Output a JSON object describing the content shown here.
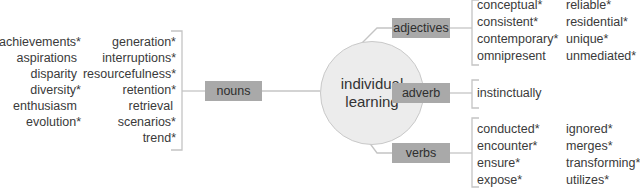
{
  "center": {
    "line1": "individual",
    "line2": "learning"
  },
  "branches": {
    "nouns": {
      "label": "nouns",
      "col1": [
        "achievements*",
        "aspirations",
        "disparity",
        "diversity*",
        "enthusiasm",
        "evolution*"
      ],
      "col2": [
        "generation*",
        "interruptions*",
        "resourcefulness*",
        "retention*",
        "retrieval",
        "scenarios*",
        "trend*"
      ]
    },
    "adjectives": {
      "label": "adjectives",
      "col1": [
        "conceptual*",
        "consistent*",
        "contemporary*",
        "omnipresent"
      ],
      "col2": [
        "reliable*",
        "residential*",
        "unique*",
        "unmediated*"
      ]
    },
    "adverb": {
      "label": "adverb",
      "col1": [
        "instinctually"
      ]
    },
    "verbs": {
      "label": "verbs",
      "col1": [
        "conducted*",
        "encounter*",
        "ensure*",
        "expose*"
      ],
      "col2": [
        "ignored*",
        "merges*",
        "transforming*",
        "utilizes*"
      ]
    }
  },
  "colors": {
    "box": "#a9a9a9",
    "circle": "#ececec",
    "line": "#c4c4c4",
    "text": "#3a3a3a"
  }
}
